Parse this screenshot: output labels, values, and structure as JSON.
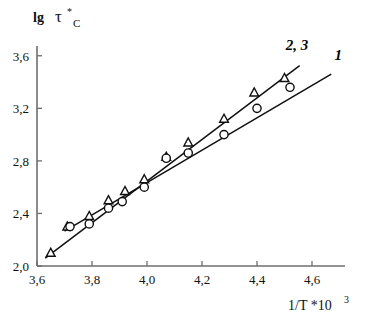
{
  "chart_data": {
    "type": "scatter",
    "title": "",
    "subtitle": "",
    "xlabel": "1/T *10^3",
    "xlabel_base": "1/T *10",
    "xlabel_exp": "3",
    "ylabel": "lg τ*_C",
    "ylabel_lg": "lg",
    "ylabel_tau": "τ",
    "ylabel_star": "*",
    "ylabel_sub": "C",
    "grid": false,
    "legend_position": "inline-right-of-lines",
    "xlim": [
      3.6,
      4.72
    ],
    "ylim": [
      2.0,
      3.72
    ],
    "xticks": [
      3.6,
      3.8,
      4.0,
      4.2,
      4.4,
      4.6
    ],
    "xtick_labels": [
      "3,6",
      "3,8",
      "4,0",
      "4,2",
      "4,4",
      "4,6"
    ],
    "yticks": [
      2.0,
      2.4,
      2.8,
      3.2,
      3.6
    ],
    "ytick_labels": [
      "2,0",
      "2,4",
      "2,8",
      "3,2",
      "3,6"
    ],
    "decimal_separator": ",",
    "series": [
      {
        "name": "2, 3",
        "label": "2, 3",
        "marker": "triangle",
        "marker_filled": false,
        "x": [
          3.65,
          3.71,
          3.79,
          3.86,
          3.92,
          3.99,
          4.07,
          4.15,
          4.28,
          4.39,
          4.5
        ],
        "y": [
          2.1,
          2.3,
          2.38,
          2.5,
          2.57,
          2.66,
          2.83,
          2.94,
          3.12,
          3.32,
          3.43
        ],
        "fit_line": {
          "x0": 3.63,
          "y0": 2.06,
          "x1": 4.555,
          "y1": 3.525
        }
      },
      {
        "name": "1",
        "label": "1",
        "marker": "circle",
        "marker_filled": false,
        "x": [
          3.72,
          3.79,
          3.86,
          3.91,
          3.99,
          4.07,
          4.15,
          4.28,
          4.4,
          4.52
        ],
        "y": [
          2.3,
          2.32,
          2.44,
          2.49,
          2.6,
          2.82,
          2.86,
          3.0,
          3.2,
          3.36
        ],
        "fit_line": {
          "x0": 3.7,
          "y0": 2.265,
          "x1": 4.67,
          "y1": 3.46
        }
      }
    ],
    "annotations": [
      {
        "text": "2, 3",
        "x": 4.545,
        "y": 3.645,
        "style": "bold-italic"
      },
      {
        "text": "1",
        "x": 4.695,
        "y": 3.565,
        "style": "bold-italic"
      }
    ],
    "colors": {
      "axis": "#6e6e6e",
      "line": "#101010",
      "marker_stroke": "#101010",
      "marker_fill": "#ffffff",
      "text": "#111111",
      "background": "#ffffff"
    }
  }
}
